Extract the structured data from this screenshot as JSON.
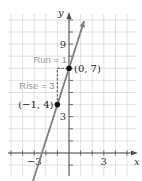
{
  "chart_data": {
    "type": "line",
    "title": "",
    "xlabel": "x",
    "ylabel": "y",
    "xlim": [
      -5,
      5
    ],
    "ylim": [
      -2,
      12
    ],
    "grid": true,
    "x_tick_labels": [
      {
        "value": -3,
        "label": "−3"
      },
      {
        "value": 3,
        "label": "3"
      }
    ],
    "y_tick_labels": [
      {
        "value": 3,
        "label": "3"
      },
      {
        "value": 9,
        "label": "9"
      }
    ],
    "x_ticks": [
      -5,
      -4,
      -3,
      -2,
      -1,
      1,
      2,
      3,
      4,
      5
    ],
    "y_ticks": [
      -1,
      1,
      2,
      3,
      4,
      5,
      6,
      7,
      8,
      9,
      10,
      11
    ],
    "series": [
      {
        "name": "line",
        "slope": 3,
        "intercept": 7,
        "x_range": [
          -3.3,
          1.3
        ],
        "color": "#808080"
      }
    ],
    "points": [
      {
        "x": -1,
        "y": 4,
        "label": "(−1, 4)"
      },
      {
        "x": 0,
        "y": 7,
        "label": "(0, 7)"
      }
    ],
    "annotations": [
      {
        "text": "Run = 1",
        "color": "#9a9a9a"
      },
      {
        "text": "Rise = 3",
        "color": "#9a9a9a"
      }
    ],
    "colors": {
      "grid": "#d6d6d6",
      "axis": "#4d4d4d",
      "line": "#808080",
      "point": "#111111",
      "annotation": "#9a9a9a",
      "dashed": "#666666"
    }
  }
}
